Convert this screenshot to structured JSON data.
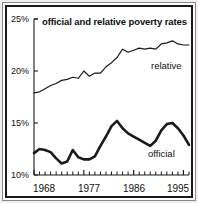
{
  "chart_data": {
    "type": "line",
    "title": "official and relative poverty rates",
    "xlabel": "",
    "ylabel": "",
    "xlim": [
      1968,
      1996
    ],
    "ylim": [
      10,
      25
    ],
    "grid": false,
    "legend_position": "inline-right",
    "y_ticks": [
      "25%",
      "20%",
      "15%",
      "10%"
    ],
    "y_tick_values": [
      25,
      20,
      15,
      10
    ],
    "x_ticks": [
      "1968",
      "1977",
      "1986",
      "1995"
    ],
    "x_tick_values": [
      1968,
      1977,
      1986,
      1995
    ],
    "x_minor_tick_interval": 1,
    "x": [
      1968,
      1969,
      1970,
      1971,
      1972,
      1973,
      1974,
      1975,
      1976,
      1977,
      1978,
      1979,
      1980,
      1981,
      1982,
      1983,
      1984,
      1985,
      1986,
      1987,
      1988,
      1989,
      1990,
      1991,
      1992,
      1993,
      1994,
      1995,
      1996
    ],
    "series": [
      {
        "name": "relative",
        "label": "relative",
        "color": "#1a1a1a",
        "line_width": 1.2,
        "values": [
          17.9,
          18.0,
          18.3,
          18.6,
          18.8,
          19.1,
          19.2,
          19.4,
          19.3,
          20.0,
          19.5,
          19.8,
          19.8,
          20.4,
          20.8,
          21.3,
          22.1,
          21.8,
          22.0,
          22.2,
          22.1,
          22.2,
          22.1,
          22.6,
          22.7,
          22.9,
          22.6,
          22.5,
          22.5
        ]
      },
      {
        "name": "official",
        "label": "official",
        "color": "#1a1a1a",
        "line_width": 2.6,
        "values": [
          12.1,
          12.5,
          12.4,
          12.2,
          11.6,
          11.1,
          11.3,
          12.4,
          11.7,
          11.5,
          11.5,
          11.8,
          12.8,
          13.7,
          14.7,
          15.2,
          14.5,
          14.0,
          13.7,
          13.4,
          13.1,
          12.8,
          13.3,
          14.3,
          14.9,
          15.0,
          14.5,
          13.8,
          12.9
        ]
      }
    ]
  }
}
